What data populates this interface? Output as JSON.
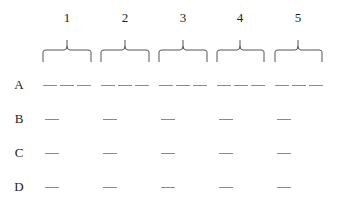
{
  "columns": [
    {
      "label": "1",
      "x_center": 67,
      "x_start": 43,
      "x_end": 91
    },
    {
      "label": "2",
      "x_center": 125,
      "x_start": 101,
      "x_end": 149
    },
    {
      "label": "3",
      "x_center": 183,
      "x_start": 159,
      "x_end": 207
    },
    {
      "label": "4",
      "x_center": 240,
      "x_start": 217,
      "x_end": 264
    },
    {
      "label": "5",
      "x_center": 298,
      "x_start": 275,
      "x_end": 322
    }
  ],
  "rows": [
    {
      "label": "A",
      "y": 85,
      "blanks_per_column": 3
    },
    {
      "label": "B",
      "y": 119,
      "blanks_per_column": 1
    },
    {
      "label": "C",
      "y": 153,
      "blanks_per_column": 1
    },
    {
      "label": "D",
      "y": 187,
      "blanks_per_column": 1
    }
  ],
  "colors": {
    "line": "#8a8a8a",
    "brace": "#555555",
    "text": "#222222"
  }
}
